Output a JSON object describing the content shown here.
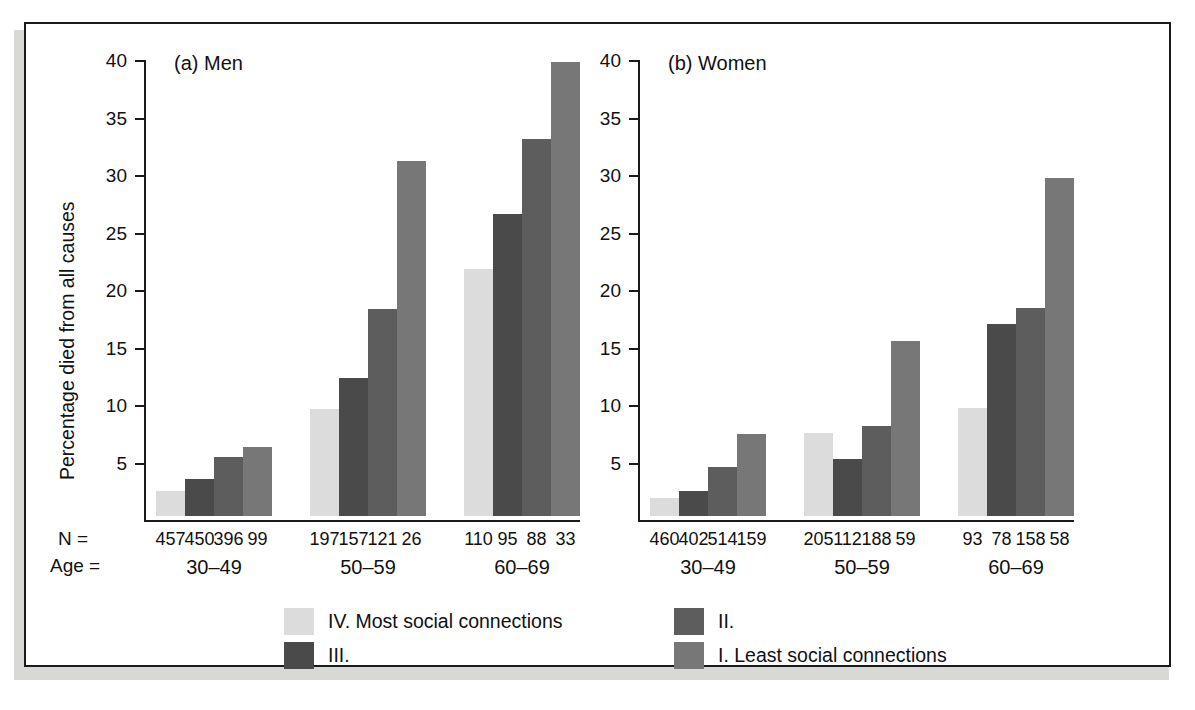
{
  "figure": {
    "panel_a_title": "(a) Men",
    "panel_b_title": "(b) Women",
    "ylabel": "Percentage died from all causes",
    "n_row_key": "N =",
    "age_row_key": "Age ="
  },
  "legend": {
    "items": [
      {
        "label": "IV. Most social connections",
        "color": "#dcdcdc",
        "name": "legend-iv"
      },
      {
        "label": "II.",
        "color": "#5d5d5d",
        "name": "legend-ii"
      },
      {
        "label": "III.",
        "color": "#4a4a4a",
        "name": "legend-iii"
      },
      {
        "label": "I. Least social connections",
        "color": "#777777",
        "name": "legend-i"
      }
    ]
  },
  "chart_data": {
    "type": "bar",
    "xlabel": "Age =",
    "ylabel": "Percentage died from all causes",
    "ylim": [
      0,
      40
    ],
    "yticks": [
      5,
      10,
      15,
      20,
      25,
      30,
      35,
      40
    ],
    "grid": false,
    "legend_position": "bottom",
    "series": [
      {
        "name": "IV. Most social connections",
        "color": "#dcdcdc"
      },
      {
        "name": "III.",
        "color": "#4a4a4a"
      },
      {
        "name": "II.",
        "color": "#5d5d5d"
      },
      {
        "name": "I. Least social connections",
        "color": "#777777"
      }
    ],
    "panels": [
      {
        "key": "a",
        "title": "(a) Men",
        "categories": [
          "30–49",
          "50–59",
          "60–69"
        ],
        "groups": [
          {
            "age": "30–49",
            "values": [
              2.2,
              3.2,
              5.1,
              6.0
            ],
            "n": [
              457,
              450,
              396,
              99
            ]
          },
          {
            "age": "50–59",
            "values": [
              9.3,
              12.0,
              18.0,
              30.9
            ],
            "n": [
              197,
              157,
              121,
              26
            ]
          },
          {
            "age": "60–69",
            "values": [
              21.5,
              26.3,
              32.8,
              39.5
            ],
            "n": [
              110,
              95,
              88,
              33
            ]
          }
        ]
      },
      {
        "key": "b",
        "title": "(b) Women",
        "categories": [
          "30–49",
          "50–59",
          "60–69"
        ],
        "groups": [
          {
            "age": "30–49",
            "values": [
              1.6,
              2.2,
              4.3,
              7.1
            ],
            "n": [
              460,
              402,
              514,
              159
            ]
          },
          {
            "age": "50–59",
            "values": [
              7.2,
              5.0,
              7.8,
              15.2
            ],
            "n": [
              205,
              112,
              188,
              59
            ]
          },
          {
            "age": "60–69",
            "values": [
              9.4,
              16.7,
              18.1,
              29.4
            ],
            "n": [
              93,
              78,
              158,
              58
            ]
          }
        ]
      }
    ]
  }
}
